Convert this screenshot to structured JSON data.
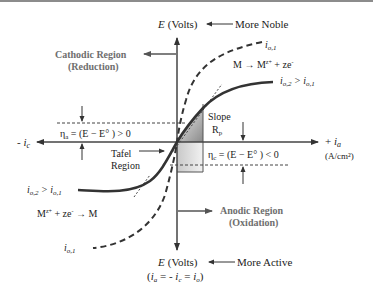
{
  "diagram": {
    "type": "evans-polarization-diagram",
    "axes": {
      "y_top_label": "E (Volts)",
      "y_top_note": "More Noble",
      "y_bottom_label": "E (Volts)",
      "y_bottom_note": "More Active",
      "y_bottom_equation": "(i_a = - i_c = i_o)",
      "x_left_label": "- i_c",
      "x_right_label": "+ i_a",
      "x_right_units": "(A/cm²)"
    },
    "regions": {
      "cathodic_title": "Cathodic Region",
      "cathodic_sub": "(Reduction)",
      "anodic_title": "Anodic Region",
      "anodic_sub": "(Oxidation)",
      "tafel_line1": "Tafel",
      "tafel_line2": "Region"
    },
    "overpotentials": {
      "anodic": "η_a = (E − E° ) > 0",
      "cathodic": "η_c = (E − E° )  <  0"
    },
    "slope": {
      "line1": "Slope",
      "line2": "R_p"
    },
    "curves": {
      "dashed_label_top": "i_o,1",
      "dashed_label_bottom": "i_o,1",
      "solid_label_right": "i_o,2 > i_o,1",
      "solid_label_left": "i_o,2 > i_o,1"
    },
    "reactions": {
      "anodic": "M → M^z+ + ze⁻",
      "cathodic": "M^z+ + ze⁻ → M"
    },
    "colors": {
      "curve": "#333333",
      "region_text": "#6e6e6e",
      "box_dark": "#8a8a8a",
      "box_light": "#e6e6e6"
    }
  }
}
